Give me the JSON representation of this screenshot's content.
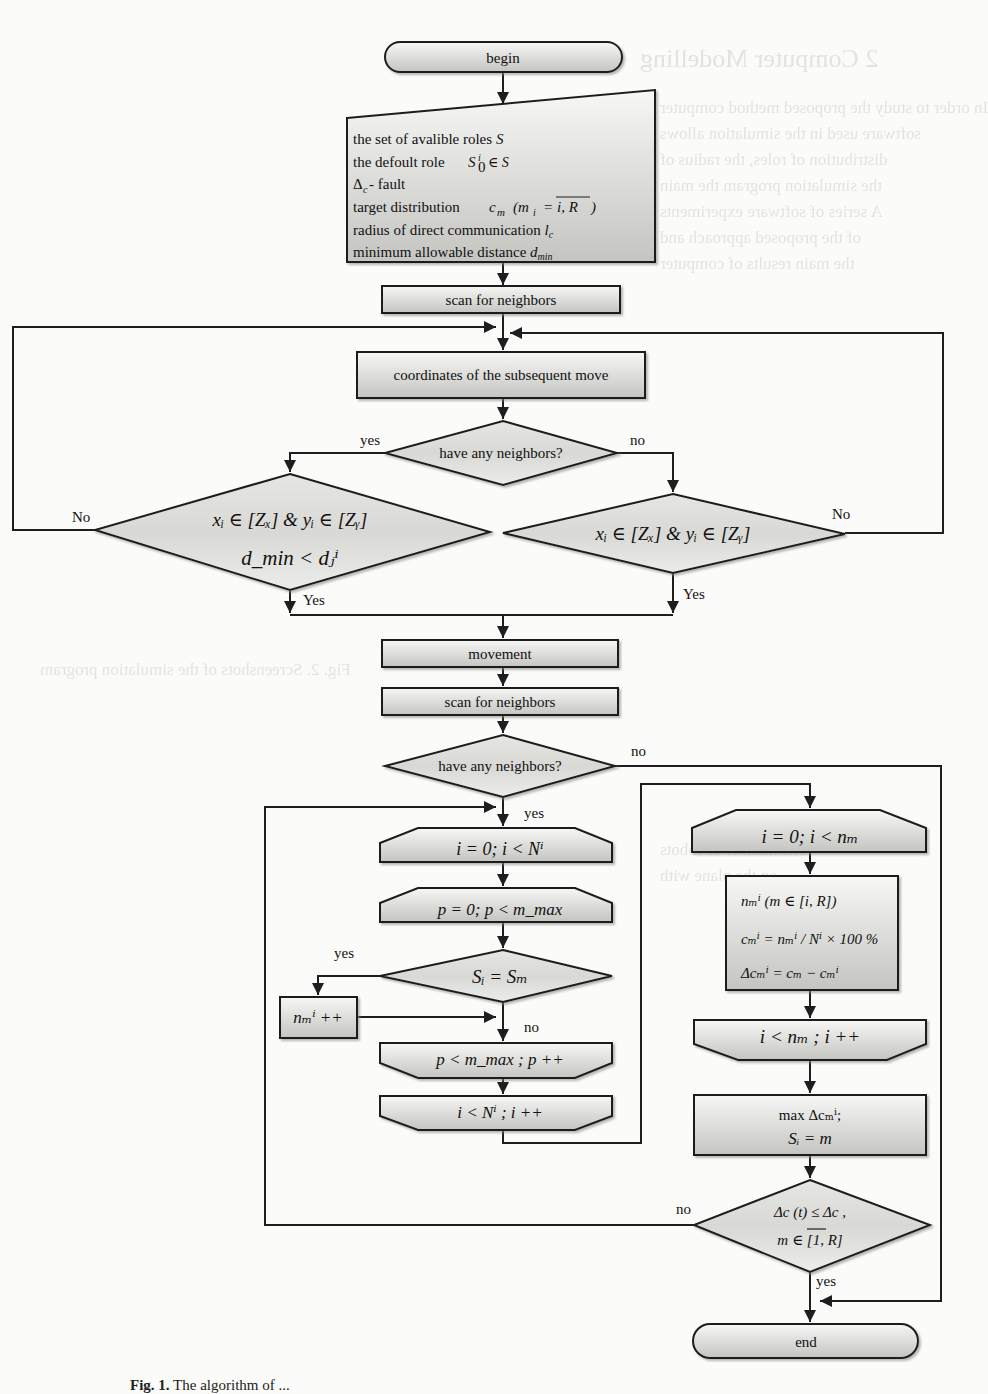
{
  "figure": {
    "caption_prefix": "Fig. 1.",
    "caption_text": "The algorithm of ..."
  },
  "nodes": {
    "begin": "begin",
    "input": {
      "lines": [
        "the set of avalible roles S",
        "the defoult role  S₀ⁱ ∈ S",
        "Δc - fault",
        "target distribution  c_m (mᵢ = ̅i,̅R)",
        "radius of direct communication l_c",
        "minimum allowable distance d_min"
      ],
      "line1_text": "the set of avalible roles ",
      "line1_sym": "S",
      "line2_text": "the defoult role",
      "line2_sym": "S",
      "line2_sup": "i",
      "line2_sub": "0",
      "line2_tail": "∈ S",
      "line3_sym": "Δ",
      "line3_sub": "c",
      "line3_text": " - fault",
      "line4_text": "target distribution",
      "line4_sym": "c",
      "line4_sub": "m",
      "line4_expr": "(m",
      "line4_sub2": "i",
      "line4_eq": "=",
      "line4_range": "i, R",
      "line4_close": ")",
      "line5_text": "radius of direct communication ",
      "line5_sym": "l",
      "line5_sub": "c",
      "line6_text": "minimum allowable distance ",
      "line6_sym": "d",
      "line6_sub": "min"
    },
    "scan_1": "scan for neighbors",
    "coordinates": "coordinates of the subsequent move",
    "decision_1": "have any neighbors?",
    "decision_left": {
      "line1": "xᵢ ∈ [Zₓ] & yᵢ ∈ [Zᵧ]",
      "line2": "d_min < dⱼⁱ"
    },
    "decision_right": {
      "line1": "xᵢ ∈ [Zₓ] & yᵢ ∈ [Zᵧ]"
    },
    "movement": "movement",
    "scan_2": "scan for neighbors",
    "decision_2": "have any neighbors?",
    "loop_i_start": "i = 0; i < Nⁱ",
    "loop_p_start": "p = 0; p < m_max",
    "decision_s": "Sᵢ = Sₘ",
    "increment": "nₘⁱ ++",
    "loop_p_end": "p < m_max ; p ++",
    "loop_i_end": "i < Nⁱ ; i ++",
    "loop_i2_start": "i = 0; i < nₘ",
    "compute": {
      "line1": "nₘⁱ (m ∈ [i, R])",
      "line2": "cₘⁱ = nₘⁱ / Nⁱ × 100 %",
      "line3": "Δcₘⁱ = cₘ − cₘⁱ"
    },
    "loop_i2_end": "i < nₘ ; i ++",
    "select": {
      "line1": "max Δcₘⁱ;",
      "line2": "Sᵢ = m"
    },
    "decision_final": {
      "line1": "Δc (t) ≤ Δc ,",
      "line2": "m ∈ [1, R]"
    },
    "end": "end"
  },
  "edge_labels": {
    "d1_yes": "yes",
    "d1_no": "no",
    "dl_no": "No",
    "dl_yes": "Yes",
    "dr_no": "No",
    "dr_yes": "Yes",
    "d2_no": "no",
    "d2_yes": "yes",
    "ds_yes": "yes",
    "ds_no": "no",
    "df_no": "no",
    "df_yes": "yes"
  },
  "colors": {
    "stroke": "#1e1e1e",
    "fill_light": "#f4f4f2",
    "fill_dark": "#c9c9c6",
    "background": "#fbfbf9"
  }
}
